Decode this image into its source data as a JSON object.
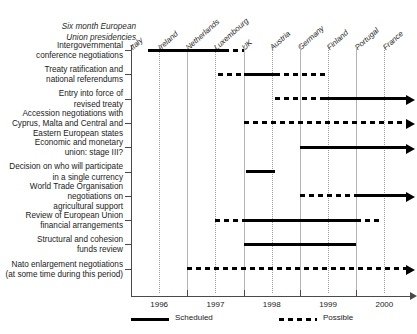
{
  "header": {
    "title_line1": "Six month European",
    "title_line2": "Union presidencies"
  },
  "chart_data": {
    "type": "bar",
    "title": "Six month European Union presidencies",
    "xlabel": "",
    "ylabel": "",
    "xlim": [
      1996,
      2000.9
    ],
    "grid": true,
    "legend_position": "bottom-left",
    "x_tick_labels": [
      "1996",
      "1997",
      "1998",
      "1999",
      "2000"
    ],
    "x_tick_values": [
      1996,
      1997,
      1998,
      1999,
      2000
    ],
    "presidencies": [
      {
        "country": "Italy",
        "start": 1996.0
      },
      {
        "country": "Ireland",
        "start": 1996.5
      },
      {
        "country": "Netherlands",
        "start": 1997.0
      },
      {
        "country": "Luxembourg",
        "start": 1997.5
      },
      {
        "country": "UK",
        "start": 1998.0
      },
      {
        "country": "Austria",
        "start": 1998.5
      },
      {
        "country": "Germany",
        "start": 1999.0
      },
      {
        "country": "Finland",
        "start": 1999.5
      },
      {
        "country": "Portugal",
        "start": 2000.0
      },
      {
        "country": "France",
        "start": 2000.5
      }
    ],
    "legend": [
      {
        "label": "Scheduled",
        "style": "solid"
      },
      {
        "label": "Possible",
        "style": "dashed"
      }
    ],
    "categories": [
      "Intergovernmental conference negotiations",
      "Treaty ratification and national referendums",
      "Entry into force of revised treaty",
      "Accession negotiations with Cyprus, Malta and Central and Eastern European states",
      "Economic and monetary union: stage III?",
      "Decision on who will participate in a single currency",
      "World Trade Organisation negotiations on agricultural support",
      "Review of European Union financial arrangements",
      "Structural and cohesion funds review",
      "Nato enlargement negotiations (at some time during this period)"
    ],
    "tasks": [
      {
        "label_lines": [
          "Intergovernmental",
          "conference negotiations"
        ],
        "segments": [
          {
            "style": "solid",
            "start": 1996.3,
            "end": 1997.65
          },
          {
            "style": "dashed",
            "start": 1997.65,
            "end": 1998.0
          }
        ],
        "arrow": false
      },
      {
        "label_lines": [
          "Treaty ratification and",
          "national referendums"
        ],
        "segments": [
          {
            "style": "dashed",
            "start": 1997.55,
            "end": 1998.0
          },
          {
            "style": "solid",
            "start": 1998.0,
            "end": 1998.55
          },
          {
            "style": "dashed",
            "start": 1998.55,
            "end": 1999.45
          }
        ],
        "arrow": false
      },
      {
        "label_lines": [
          "Entry into force of",
          "revised treaty"
        ],
        "segments": [
          {
            "style": "dashed",
            "start": 1998.55,
            "end": 1999.45
          },
          {
            "style": "solid",
            "start": 1999.45,
            "end": 2000.9
          }
        ],
        "arrow": true
      },
      {
        "label_lines": [
          "Accession negotiations with",
          "Cyprus, Malta and Central and",
          "Eastern European states"
        ],
        "segments": [
          {
            "style": "dashed",
            "start": 1998.0,
            "end": 2000.9
          }
        ],
        "arrow": true
      },
      {
        "label_lines": [
          "Economic and monetary",
          "union: stage III?"
        ],
        "segments": [
          {
            "style": "solid",
            "start": 1999.0,
            "end": 2000.9
          }
        ],
        "arrow": true
      },
      {
        "label_lines": [
          "Decision on who will participate",
          "in a single currency"
        ],
        "segments": [
          {
            "style": "solid",
            "start": 1998.05,
            "end": 1998.55
          }
        ],
        "arrow": false
      },
      {
        "label_lines": [
          "World Trade Organisation",
          "negotiations on",
          "agricultural support"
        ],
        "segments": [
          {
            "style": "dashed",
            "start": 1999.0,
            "end": 2000.0
          },
          {
            "style": "solid",
            "start": 2000.0,
            "end": 2000.9
          }
        ],
        "arrow": true
      },
      {
        "label_lines": [
          "Review of European Union",
          "financial arrangements"
        ],
        "segments": [
          {
            "style": "dashed",
            "start": 1997.5,
            "end": 1998.0
          },
          {
            "style": "solid",
            "start": 1998.0,
            "end": 2000.0
          },
          {
            "style": "dashed",
            "start": 2000.0,
            "end": 2000.4
          }
        ],
        "arrow": false
      },
      {
        "label_lines": [
          "Structural and cohesion",
          "funds review"
        ],
        "segments": [
          {
            "style": "solid",
            "start": 1998.0,
            "end": 2000.0
          }
        ],
        "arrow": false
      },
      {
        "label_lines": [
          "Nato enlargement negotiations",
          "(at some time during this period)"
        ],
        "segments": [
          {
            "style": "dashed",
            "start": 1997.0,
            "end": 2000.9
          }
        ],
        "arrow": true
      }
    ]
  }
}
